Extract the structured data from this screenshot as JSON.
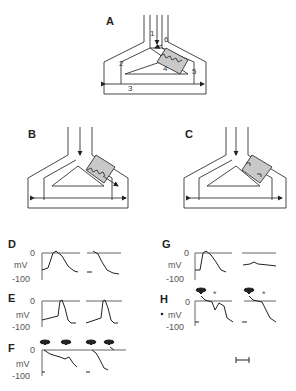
{
  "figure": {
    "panels": {
      "A": {
        "label": "A",
        "segment_numbers": [
          "1",
          "2",
          "3",
          "4",
          "5",
          "6"
        ]
      },
      "B": {
        "label": "B"
      },
      "C": {
        "label": "C"
      },
      "D": {
        "label": "D"
      },
      "E": {
        "label": "E"
      },
      "F": {
        "label": "F"
      },
      "G": {
        "label": "G"
      },
      "H": {
        "label": "H"
      }
    },
    "axis": {
      "zero": "0",
      "unit": "mV",
      "min": "-100"
    },
    "asterisk": "*",
    "colors": {
      "ink": "#222222",
      "shade": "#c8c8c8",
      "background": "#ffffff"
    }
  }
}
